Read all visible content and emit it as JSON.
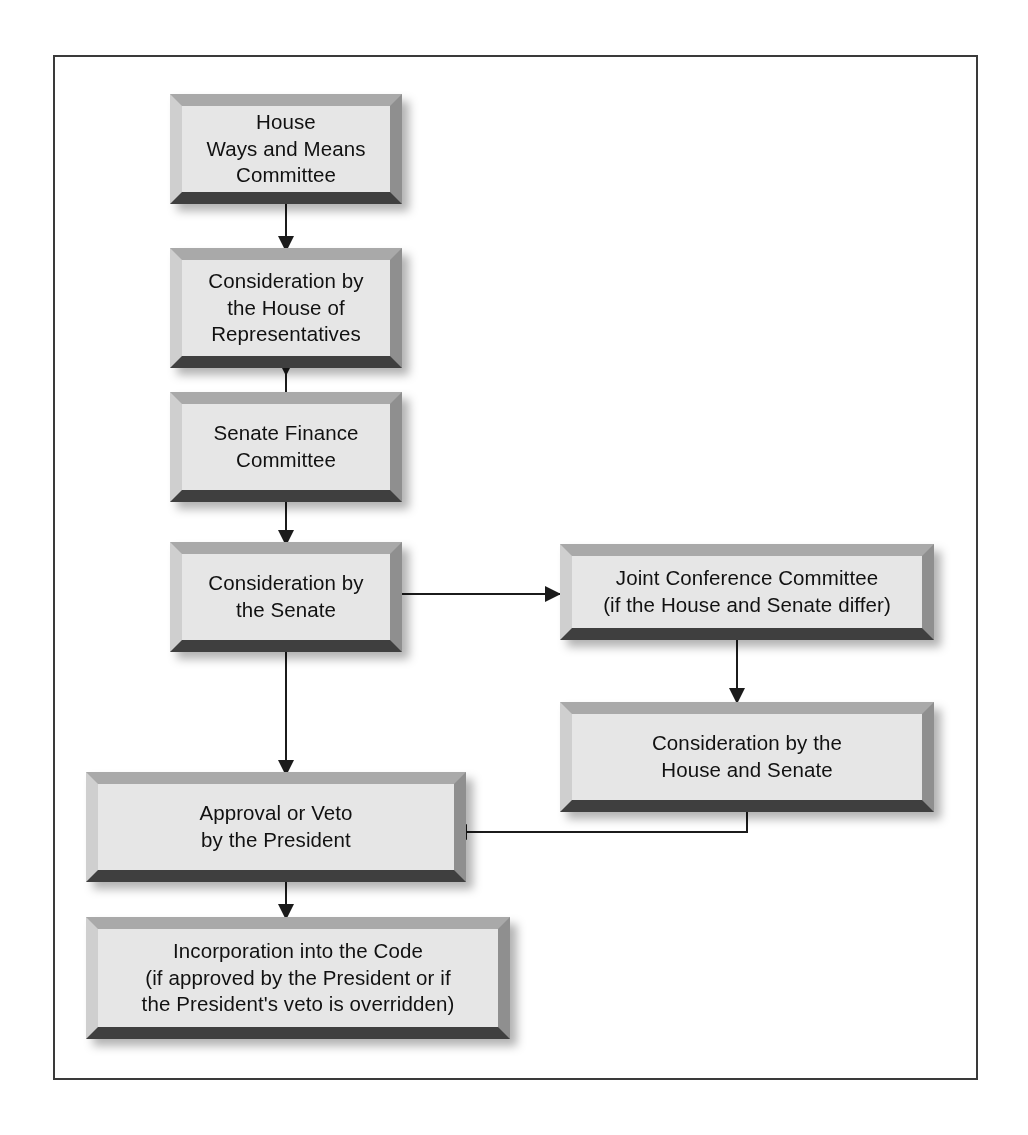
{
  "diagram": {
    "background_color": "#ffffff",
    "frame_border_color": "#3a3a3a",
    "box_face_color": "#e6e6e6",
    "box_bevel_light_color": "#cfcfcf",
    "box_bevel_dark_color": "#3f3f3f",
    "connector_color": "#1b1b1b"
  },
  "nodes": {
    "house_ways_means": {
      "id": "house-ways-and-means-committee",
      "text": "House\nWays and Means\nCommittee"
    },
    "house_consideration": {
      "id": "consideration-by-the-house-of-representatives",
      "text": "Consideration by\nthe House of\nRepresentatives"
    },
    "senate_finance": {
      "id": "senate-finance-committee",
      "text": "Senate Finance\nCommittee"
    },
    "senate_consideration": {
      "id": "consideration-by-the-senate",
      "text": "Consideration by\nthe Senate"
    },
    "joint_conference": {
      "id": "joint-conference-committee",
      "text": "Joint Conference Committee\n(if the House and Senate differ)"
    },
    "house_senate_consideration": {
      "id": "consideration-by-the-house-and-senate",
      "text": "Consideration by the\nHouse and Senate"
    },
    "president_approval": {
      "id": "approval-or-veto-by-the-president",
      "text": "Approval or Veto\nby the President"
    },
    "incorporation": {
      "id": "incorporation-into-the-code",
      "text": "Incorporation into the Code\n(if approved by the President or if\nthe President's veto is overridden)"
    }
  },
  "connections": [
    {
      "from": "house_ways_means",
      "to": "house_consideration",
      "kind": "arrow-down"
    },
    {
      "from": "house_consideration",
      "to": "senate_finance",
      "kind": "arrow-down"
    },
    {
      "from": "senate_finance",
      "to": "senate_consideration",
      "kind": "arrow-down"
    },
    {
      "from": "senate_consideration",
      "to": "joint_conference",
      "kind": "arrow-right"
    },
    {
      "from": "senate_consideration",
      "to": "president_approval",
      "kind": "arrow-down"
    },
    {
      "from": "joint_conference",
      "to": "house_senate_consideration",
      "kind": "arrow-down"
    },
    {
      "from": "house_senate_consideration",
      "to": "president_approval",
      "kind": "arrow-left-elbow"
    },
    {
      "from": "president_approval",
      "to": "incorporation",
      "kind": "arrow-down"
    }
  ]
}
